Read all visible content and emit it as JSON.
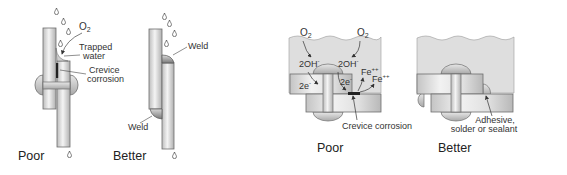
{
  "figure": {
    "left_panel": {
      "poor": {
        "caption": "Poor",
        "labels": {
          "oxygen": "O",
          "oxygen_sub": "2",
          "trapped_water_line1": "Trapped",
          "trapped_water_line2": "water",
          "crevice_line1": "Crevice",
          "crevice_line2": "corrosion"
        }
      },
      "better": {
        "caption": "Better",
        "labels": {
          "weld_top": "Weld",
          "weld_bottom": "Weld"
        }
      }
    },
    "right_panel": {
      "poor": {
        "caption": "Poor",
        "labels": {
          "oxygen_left": "O",
          "oxygen_right": "O",
          "oxygen_sub": "2",
          "hydroxide_left": "2OH",
          "hydroxide_right": "2OH",
          "hydroxide_sup": "-",
          "electron_left": "2e",
          "electron_right": "2e",
          "electron_sup": "-",
          "iron_1": "Fe",
          "iron_2": "Fe",
          "iron_sup": "++",
          "crevice": "Crevice corrosion"
        }
      },
      "better": {
        "caption": "Better",
        "labels": {
          "sealant_line1": "Adhesive,",
          "sealant_line2": "solder or sealant"
        }
      }
    },
    "colors": {
      "plate_light": "#f2f2f2",
      "plate_mid": "#c8c8c8",
      "plate_edge": "#6e6e6e",
      "water": "#dcdcdc",
      "corrosion": "#222222",
      "text": "#333333"
    }
  }
}
